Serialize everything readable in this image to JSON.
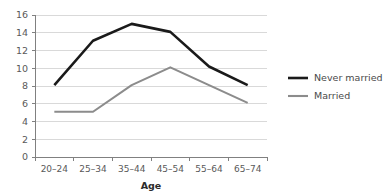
{
  "chart_data": {
    "type": "line",
    "title": "",
    "subtitle": "",
    "xlabel": "Age",
    "ylabel": "",
    "categories": [
      "20–24",
      "25–34",
      "35–44",
      "45–54",
      "55–64",
      "65–74"
    ],
    "series": [
      {
        "name": "Never married",
        "color": "#1a1a1a",
        "line_width": 2.6,
        "values": [
          8.1,
          13.1,
          15.0,
          14.1,
          10.2,
          8.1
        ]
      },
      {
        "name": "Married",
        "color": "#8c8c8c",
        "line_width": 2.1,
        "values": [
          5.1,
          5.1,
          8.1,
          10.1,
          8.1,
          6.1
        ]
      }
    ],
    "ylim": [
      0,
      16
    ],
    "ytick_step": 2,
    "yticks": [
      "0",
      "2",
      "4",
      "6",
      "8",
      "10",
      "12",
      "14",
      "16"
    ],
    "grid": true,
    "grid_axis": "y",
    "grid_color": "#d9d9d9",
    "axis_color": "#808080",
    "legend_position": "right",
    "legend": [
      "Never married",
      "Married"
    ]
  },
  "colors": {
    "background": "#ffffff",
    "never_married": "#1a1a1a",
    "married": "#8c8c8c",
    "gridline": "#d9d9d9",
    "axis": "#808080",
    "tick_text": "#595959",
    "title_text": "#2b2b2b"
  }
}
